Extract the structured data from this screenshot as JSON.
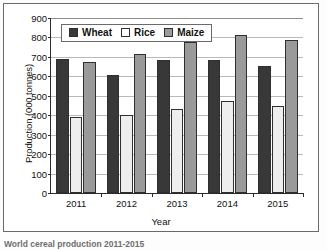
{
  "figure": {
    "caption": "World cereal production 2011-2015"
  },
  "chart_data": {
    "type": "bar",
    "title": "",
    "xlabel": "Year",
    "ylabel": "Production (000 tonnes)",
    "categories": [
      "2011",
      "2012",
      "2013",
      "2014",
      "2015"
    ],
    "series": [
      {
        "name": "Wheat",
        "color": "#383838",
        "values": [
          690,
          605,
          685,
          685,
          655
        ]
      },
      {
        "name": "Rice",
        "color": "#eeeeee",
        "values": [
          390,
          400,
          430,
          475,
          450
        ]
      },
      {
        "name": "Maize",
        "color": "#9a9a9a",
        "values": [
          675,
          715,
          775,
          815,
          785
        ]
      }
    ],
    "ylim": [
      0,
      900
    ],
    "ytick_step": 100,
    "yticks": [
      0,
      100,
      200,
      300,
      400,
      500,
      600,
      700,
      800,
      900
    ],
    "grid": true,
    "legend_position": "top-left-inside",
    "legend_entries": [
      "Wheat",
      "Rice",
      "Maize"
    ]
  }
}
